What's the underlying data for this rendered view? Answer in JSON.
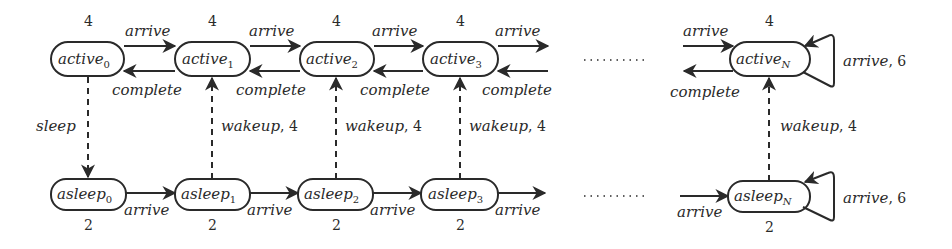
{
  "diagram": {
    "type": "state-machine",
    "ellipsis": "………",
    "active_row": {
      "nodes": [
        {
          "name": "active",
          "sub": "0",
          "weight": "4"
        },
        {
          "name": "active",
          "sub": "1",
          "weight": "4"
        },
        {
          "name": "active",
          "sub": "2",
          "weight": "4"
        },
        {
          "name": "active",
          "sub": "3",
          "weight": "4"
        },
        {
          "name": "active",
          "sub": "N",
          "weight": "4"
        }
      ],
      "forward_label": "arrive",
      "backward_label": "complete",
      "self_loop_label": "arrive",
      "self_loop_weight": ", 6"
    },
    "asleep_row": {
      "nodes": [
        {
          "name": "asleep",
          "sub": "0",
          "weight": "2"
        },
        {
          "name": "asleep",
          "sub": "1",
          "weight": "2"
        },
        {
          "name": "asleep",
          "sub": "2",
          "weight": "2"
        },
        {
          "name": "asleep",
          "sub": "3",
          "weight": "2"
        },
        {
          "name": "asleep",
          "sub": "N",
          "weight": "2"
        }
      ],
      "forward_label": "arrive",
      "self_loop_label": "arrive",
      "self_loop_weight": ", 6"
    },
    "vertical": {
      "sleep_label": "sleep",
      "wakeup_label": "wakeup",
      "wakeup_weight": ", 4"
    }
  }
}
